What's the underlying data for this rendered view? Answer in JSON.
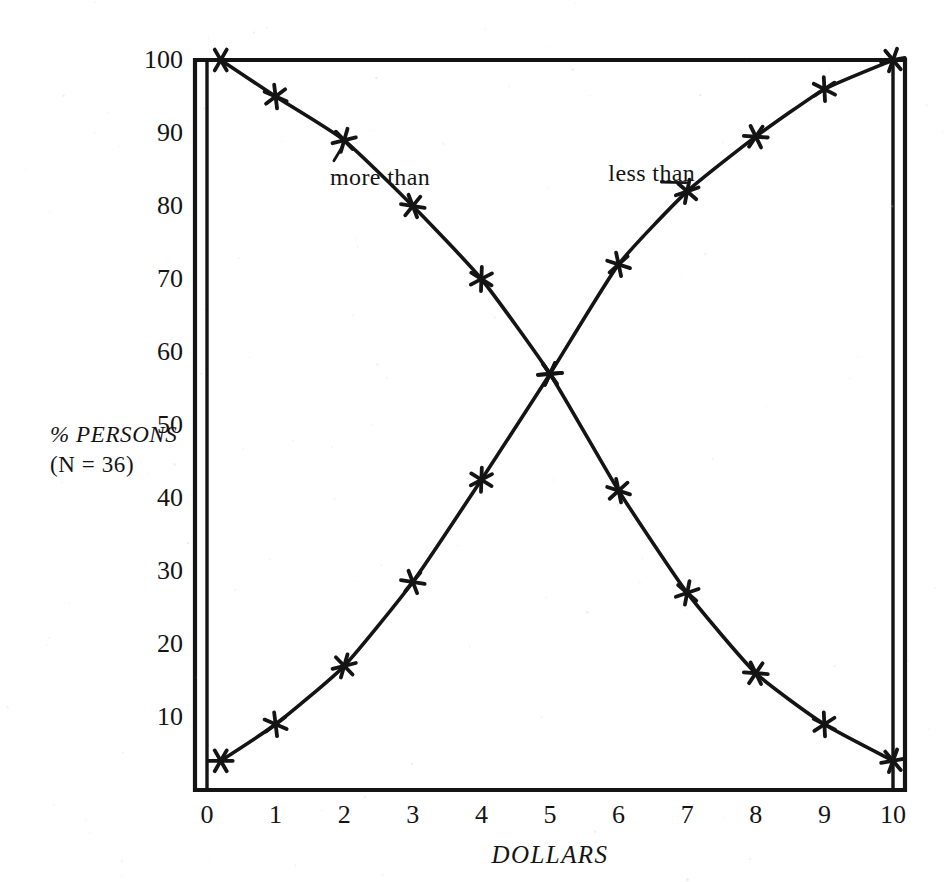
{
  "chart_data": {
    "type": "line",
    "title": "",
    "subtitle": "",
    "xlabel": "DOLLARS",
    "ylabel": "% PERSONS",
    "ylabel_sub": "(N = 36)",
    "xlim": [
      0,
      10
    ],
    "ylim": [
      0,
      100
    ],
    "xticks": [
      "0",
      "1",
      "2",
      "3",
      "4",
      "5",
      "6",
      "7",
      "8",
      "9",
      "10"
    ],
    "yticks": [
      "10",
      "20",
      "30",
      "40",
      "50",
      "60",
      "70",
      "80",
      "90",
      "100"
    ],
    "grid": false,
    "legend_position": "inline-annotations",
    "marker": "six-pointed-asterisk",
    "annotations": [
      {
        "text": "more than",
        "x": 2.55,
        "y": 84.0
      },
      {
        "text": "less than",
        "x": 6.55,
        "y": 84.5
      }
    ],
    "series": [
      {
        "name": "more than",
        "label": "more than",
        "color": "#111111",
        "x": [
          0.2,
          1,
          2,
          3,
          4,
          5,
          6,
          7,
          8,
          9,
          10
        ],
        "values": [
          100,
          95,
          89,
          80,
          70,
          57,
          41,
          27,
          16,
          9,
          4
        ]
      },
      {
        "name": "less than",
        "label": "less than",
        "color": "#111111",
        "x": [
          0.2,
          1,
          2,
          3,
          4,
          5,
          6,
          7,
          8,
          9,
          10
        ],
        "values": [
          4,
          9,
          17,
          28.5,
          42.5,
          57,
          72,
          82,
          89.5,
          96,
          100
        ]
      }
    ]
  },
  "figure": {
    "background": "#ffffff",
    "ink": "#111111",
    "frame": {
      "left": 195,
      "top": 60,
      "right": 905,
      "bottom": 790
    },
    "axis_inner_offset": 12
  }
}
